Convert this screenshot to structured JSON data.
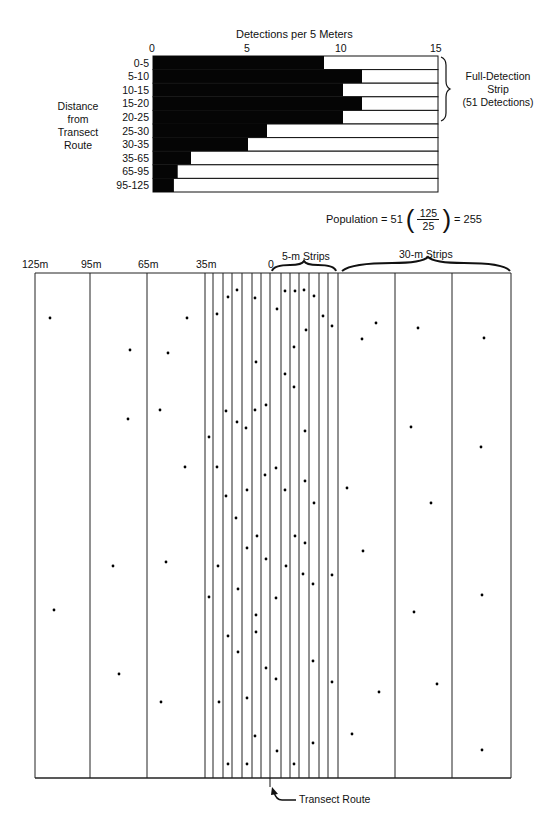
{
  "chart_data": {
    "type": "bar",
    "title": "Detections per 5 Meters",
    "xlabel": "Detections per 5 Meters",
    "ylabel": "Distance from Transect Route",
    "xlim": [
      0,
      15
    ],
    "xticks": [
      "0",
      "5",
      "10",
      "15"
    ],
    "categories": [
      "0-5",
      "5-10",
      "10-15",
      "15-20",
      "20-25",
      "25-30",
      "30-35",
      "35-65",
      "65-95",
      "95-125"
    ],
    "values": [
      9,
      11,
      10,
      11,
      10,
      6,
      5,
      2,
      1.3,
      1.1
    ],
    "full_scale": 15,
    "annotation": "Full-Detection Strip (51 Detections)",
    "formula": "Population = 51 (125/25) = 255"
  },
  "bar_chart": {
    "axis_title": "Detections per 5 Meters",
    "ticks": [
      {
        "label": "0",
        "v": 0
      },
      {
        "label": "5",
        "v": 5
      },
      {
        "label": "10",
        "v": 10
      },
      {
        "label": "15",
        "v": 15
      }
    ],
    "ylabel_lines": [
      "Distance",
      "from",
      "Transect",
      "Route"
    ],
    "brace_label_lines": [
      "Full-Detection",
      "Strip",
      "(51 Detections)"
    ],
    "formula": {
      "prefix": "Population = 51",
      "numerator": "125",
      "denominator": "25",
      "suffix": "= 255"
    }
  },
  "strip_map": {
    "distance_labels": [
      {
        "label": "125m",
        "x": 22
      },
      {
        "label": "95m",
        "x": 81
      },
      {
        "label": "65m",
        "x": 138
      },
      {
        "label": "35m",
        "x": 196
      },
      {
        "label": "0",
        "x": 268
      }
    ],
    "five_m_label": "5-m Strips",
    "thirty_m_label": "30-m Strips",
    "transect_label": "Transect Route",
    "lines_x": [
      35,
      90,
      147,
      205,
      213,
      223,
      232,
      242,
      252,
      261,
      270,
      281,
      290,
      299,
      309,
      319,
      328,
      338,
      395,
      452,
      511
    ],
    "top": 273,
    "bottom": 778,
    "transect_x": 270,
    "dots": [
      [
        217,
        314
      ],
      [
        228,
        297
      ],
      [
        237,
        290
      ],
      [
        255,
        298
      ],
      [
        277,
        309
      ],
      [
        285,
        291
      ],
      [
        295,
        291
      ],
      [
        304,
        290
      ],
      [
        314,
        296
      ],
      [
        323,
        316
      ],
      [
        332,
        326
      ],
      [
        306,
        330
      ],
      [
        294,
        347
      ],
      [
        256,
        362
      ],
      [
        285,
        374
      ],
      [
        294,
        387
      ],
      [
        226,
        411
      ],
      [
        255,
        410
      ],
      [
        266,
        405
      ],
      [
        237,
        422
      ],
      [
        246,
        428
      ],
      [
        209,
        437
      ],
      [
        305,
        431
      ],
      [
        217,
        467
      ],
      [
        265,
        475
      ],
      [
        276,
        468
      ],
      [
        305,
        481
      ],
      [
        226,
        496
      ],
      [
        247,
        490
      ],
      [
        285,
        490
      ],
      [
        314,
        503
      ],
      [
        236,
        518
      ],
      [
        257,
        536
      ],
      [
        295,
        536
      ],
      [
        305,
        543
      ],
      [
        247,
        548
      ],
      [
        266,
        559
      ],
      [
        218,
        566
      ],
      [
        286,
        566
      ],
      [
        303,
        574
      ],
      [
        313,
        584
      ],
      [
        332,
        575
      ],
      [
        238,
        589
      ],
      [
        209,
        597
      ],
      [
        276,
        598
      ],
      [
        256,
        615
      ],
      [
        256,
        632
      ],
      [
        228,
        636
      ],
      [
        238,
        652
      ],
      [
        313,
        661
      ],
      [
        266,
        668
      ],
      [
        276,
        679
      ],
      [
        332,
        682
      ],
      [
        247,
        698
      ],
      [
        219,
        702
      ],
      [
        255,
        736
      ],
      [
        277,
        751
      ],
      [
        313,
        743
      ],
      [
        228,
        764
      ],
      [
        247,
        764
      ],
      [
        294,
        764
      ],
      [
        376,
        323
      ],
      [
        362,
        339
      ],
      [
        418,
        328
      ],
      [
        484,
        338
      ],
      [
        411,
        427
      ],
      [
        481,
        447
      ],
      [
        347,
        488
      ],
      [
        431,
        503
      ],
      [
        363,
        551
      ],
      [
        482,
        595
      ],
      [
        414,
        612
      ],
      [
        437,
        684
      ],
      [
        379,
        692
      ],
      [
        352,
        734
      ],
      [
        482,
        750
      ],
      [
        50,
        318
      ],
      [
        187,
        318
      ],
      [
        130,
        350
      ],
      [
        168,
        353
      ],
      [
        160,
        410
      ],
      [
        128,
        419
      ],
      [
        185,
        467
      ],
      [
        113,
        566
      ],
      [
        166,
        562
      ],
      [
        54,
        610
      ],
      [
        119,
        674
      ],
      [
        161,
        702
      ]
    ]
  }
}
